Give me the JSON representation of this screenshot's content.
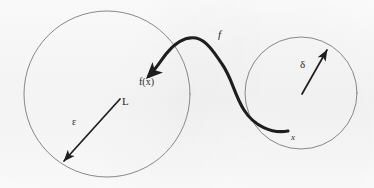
{
  "figure": {
    "kind": "hand-drawn-math-diagram",
    "topic": "epsilon-delta definition of continuity",
    "background_color": "#fbfbfb",
    "ink_color": "#2a2a2a",
    "thin_stroke_color": "#6b6b6b",
    "width": 374,
    "height": 188
  },
  "shapes": {
    "target_circle": {
      "name": "epsilon-ball",
      "cx": 107,
      "cy": 94,
      "r": 83,
      "stroke": "#7a7a7a",
      "stroke_width": 0.9
    },
    "source_circle": {
      "name": "delta-ball",
      "cx": 301,
      "cy": 93,
      "r": 56,
      "stroke": "#7a7a7a",
      "stroke_width": 0.9
    },
    "mapping_curve": {
      "name": "function-curve-f",
      "stroke": "#1e1e1e",
      "stroke_width": 3.1,
      "path": "M 288 131 C 272 134 254 126 244 110 C 234 94 232 78 222 64 C 214 52 206 40 196 38 C 184 36 174 44 166 54 C 160 62 155 70 148 77",
      "arrow_tip": {
        "x": 146,
        "y": 79
      },
      "tail_end": {
        "x": 288,
        "y": 131
      }
    },
    "epsilon_arrow": {
      "name": "epsilon-radius-arrow",
      "stroke": "#1e1e1e",
      "stroke_width": 1.7,
      "from": {
        "x": 120,
        "y": 99
      },
      "to": {
        "x": 62,
        "y": 163
      }
    },
    "delta_arrow": {
      "name": "delta-radius-arrow",
      "stroke": "#1e1e1e",
      "stroke_width": 1.7,
      "from": {
        "x": 302,
        "y": 94
      },
      "to": {
        "x": 328,
        "y": 48
      }
    }
  },
  "labels": {
    "limit_point": "L",
    "epsilon": "ε",
    "image_point": "f(x)",
    "function": "f",
    "delta": "δ",
    "domain_point": "x"
  }
}
